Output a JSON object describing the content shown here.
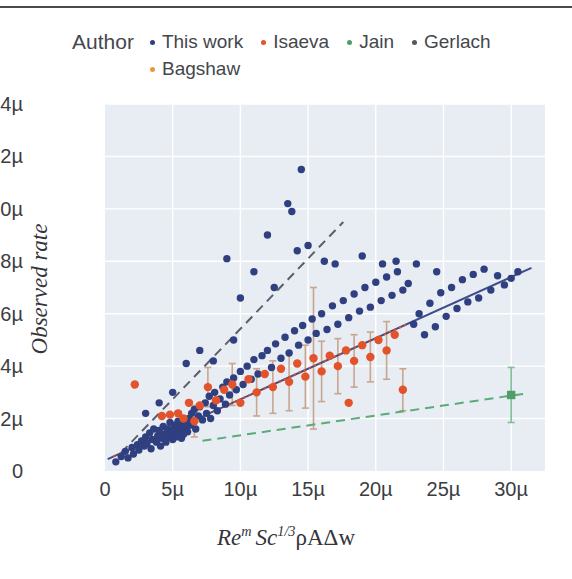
{
  "figure": {
    "background": "#ffffff",
    "plot_background": "#e7edf2",
    "gridline_color": "#ffffff"
  },
  "legend": {
    "title": "Author",
    "entries": [
      {
        "label": "This work",
        "color": "#2f3f7f",
        "row": 1
      },
      {
        "label": "Isaeva",
        "color": "#e2522b",
        "row": 1
      },
      {
        "label": "Jain",
        "color": "#4f9e6a",
        "row": 1
      },
      {
        "label": "Gerlach",
        "color": "#55585f",
        "row": 1
      },
      {
        "label": "Bagshaw",
        "color": "#e79a3c",
        "row": 2
      }
    ]
  },
  "chart_data": {
    "type": "scatter",
    "title": "",
    "xlabel": "Re^m Sc^{1/3} ρAΔw",
    "ylabel": "Observed rate",
    "xlabel_parts": {
      "re": "Re",
      "m": "m",
      "sc": "Sc",
      "third": "1/3",
      "tail": "ρAΔw"
    },
    "xlim": [
      0,
      32.5
    ],
    "ylim": [
      0,
      14
    ],
    "xticks": [
      0,
      5,
      10,
      15,
      20,
      25,
      30
    ],
    "xticklabels": [
      "0",
      "5µ",
      "10µ",
      "15µ",
      "20µ",
      "25µ",
      "30µ"
    ],
    "yticks": [
      0,
      2,
      4,
      6,
      8,
      10,
      12,
      14
    ],
    "yticklabels": [
      "0",
      "2µ",
      "4µ",
      "6µ",
      "8µ",
      "10µ",
      "12µ",
      "14µ"
    ],
    "grid": true,
    "grid_axis": "both",
    "legend_position": "above-plot",
    "units": "µ (micro)",
    "series": [
      {
        "name": "This work",
        "color": "#2f3f7f",
        "marker": "circle",
        "marker_size": 5,
        "points": [
          [
            0.8,
            0.35
          ],
          [
            1.2,
            0.55
          ],
          [
            1.5,
            0.75
          ],
          [
            1.7,
            0.5
          ],
          [
            2.0,
            0.9
          ],
          [
            2.1,
            0.65
          ],
          [
            2.4,
            1.0
          ],
          [
            2.5,
            0.8
          ],
          [
            2.7,
            1.15
          ],
          [
            2.9,
            0.95
          ],
          [
            3.0,
            1.3
          ],
          [
            3.1,
            1.05
          ],
          [
            3.3,
            1.45
          ],
          [
            3.4,
            0.85
          ],
          [
            3.5,
            1.2
          ],
          [
            3.6,
            1.6
          ],
          [
            3.8,
            1.1
          ],
          [
            3.9,
            1.35
          ],
          [
            4.0,
            1.55
          ],
          [
            4.1,
            0.95
          ],
          [
            4.2,
            1.25
          ],
          [
            4.3,
            1.7
          ],
          [
            4.4,
            1.4
          ],
          [
            4.5,
            1.1
          ],
          [
            4.6,
            1.6
          ],
          [
            4.7,
            1.3
          ],
          [
            4.8,
            1.85
          ],
          [
            4.9,
            1.45
          ],
          [
            5.0,
            1.2
          ],
          [
            5.05,
            1.6
          ],
          [
            5.1,
            1.35
          ],
          [
            5.15,
            1.75
          ],
          [
            5.2,
            1.5
          ],
          [
            5.25,
            1.3
          ],
          [
            5.3,
            1.65
          ],
          [
            5.35,
            1.45
          ],
          [
            5.4,
            1.9
          ],
          [
            5.45,
            1.55
          ],
          [
            5.5,
            1.35
          ],
          [
            5.55,
            1.7
          ],
          [
            5.6,
            1.5
          ],
          [
            5.65,
            1.25
          ],
          [
            5.7,
            1.8
          ],
          [
            5.75,
            1.6
          ],
          [
            5.8,
            1.4
          ],
          [
            5.9,
            1.95
          ],
          [
            6.0,
            1.7
          ],
          [
            6.1,
            1.5
          ],
          [
            6.2,
            2.0
          ],
          [
            6.3,
            1.75
          ],
          [
            6.4,
            2.2
          ],
          [
            6.5,
            1.9
          ],
          [
            6.6,
            2.35
          ],
          [
            6.7,
            1.6
          ],
          [
            6.9,
            2.1
          ],
          [
            7.0,
            2.45
          ],
          [
            7.2,
            1.95
          ],
          [
            7.4,
            2.6
          ],
          [
            7.5,
            2.2
          ],
          [
            7.7,
            2.85
          ],
          [
            7.8,
            2.0
          ],
          [
            8.0,
            2.5
          ],
          [
            8.1,
            3.0
          ],
          [
            8.3,
            2.3
          ],
          [
            8.5,
            2.75
          ],
          [
            8.7,
            3.2
          ],
          [
            8.9,
            2.55
          ],
          [
            9.0,
            3.4
          ],
          [
            9.2,
            2.9
          ],
          [
            9.5,
            3.55
          ],
          [
            9.7,
            3.1
          ],
          [
            10.0,
            3.8
          ],
          [
            10.2,
            3.3
          ],
          [
            10.5,
            4.0
          ],
          [
            10.8,
            3.5
          ],
          [
            11.0,
            4.25
          ],
          [
            11.3,
            3.7
          ],
          [
            11.6,
            4.4
          ],
          [
            12.0,
            4.6
          ],
          [
            12.3,
            3.95
          ],
          [
            12.6,
            4.85
          ],
          [
            13.0,
            4.3
          ],
          [
            13.3,
            5.1
          ],
          [
            13.6,
            4.5
          ],
          [
            14.0,
            5.35
          ],
          [
            14.3,
            4.8
          ],
          [
            14.6,
            5.55
          ],
          [
            15.0,
            5.0
          ],
          [
            15.3,
            5.8
          ],
          [
            15.6,
            5.25
          ],
          [
            16.0,
            6.0
          ],
          [
            16.4,
            5.4
          ],
          [
            16.8,
            6.3
          ],
          [
            17.2,
            5.6
          ],
          [
            17.6,
            6.5
          ],
          [
            18.0,
            5.85
          ],
          [
            18.4,
            6.75
          ],
          [
            18.8,
            6.1
          ],
          [
            19.2,
            7.0
          ],
          [
            19.6,
            6.25
          ],
          [
            20.0,
            7.2
          ],
          [
            20.4,
            6.5
          ],
          [
            20.8,
            7.4
          ],
          [
            21.2,
            6.7
          ],
          [
            21.6,
            7.6
          ],
          [
            22.0,
            6.9
          ],
          [
            22.4,
            7.15
          ],
          [
            22.8,
            5.6
          ],
          [
            23.2,
            6.0
          ],
          [
            23.6,
            5.2
          ],
          [
            24.0,
            6.4
          ],
          [
            24.4,
            5.5
          ],
          [
            24.8,
            6.8
          ],
          [
            25.2,
            5.9
          ],
          [
            25.6,
            7.0
          ],
          [
            26.0,
            6.2
          ],
          [
            26.4,
            7.3
          ],
          [
            26.8,
            6.45
          ],
          [
            27.2,
            7.5
          ],
          [
            27.6,
            6.6
          ],
          [
            28.0,
            7.7
          ],
          [
            28.5,
            6.9
          ],
          [
            29.0,
            7.45
          ],
          [
            29.5,
            7.1
          ],
          [
            30.0,
            7.35
          ],
          [
            30.5,
            7.6
          ],
          [
            14.5,
            11.5
          ],
          [
            13.5,
            10.2
          ],
          [
            12.0,
            9.0
          ],
          [
            15.0,
            8.6
          ],
          [
            16.2,
            8.0
          ],
          [
            9.0,
            8.1
          ],
          [
            13.8,
            9.9
          ],
          [
            14.2,
            8.4
          ],
          [
            11.0,
            7.6
          ],
          [
            17.0,
            7.9
          ],
          [
            12.5,
            7.0
          ],
          [
            10.0,
            6.6
          ],
          [
            19.0,
            8.2
          ],
          [
            20.5,
            7.9
          ],
          [
            21.5,
            8.0
          ],
          [
            23.0,
            7.9
          ],
          [
            24.5,
            7.6
          ],
          [
            6.0,
            4.1
          ],
          [
            7.0,
            4.6
          ],
          [
            8.0,
            4.2
          ],
          [
            9.5,
            5.0
          ],
          [
            5.0,
            3.0
          ],
          [
            4.0,
            2.6
          ],
          [
            3.0,
            2.2
          ]
        ]
      },
      {
        "name": "Isaeva",
        "color": "#e2522b",
        "marker": "circle",
        "marker_size": 6,
        "points": [
          [
            2.2,
            3.3
          ],
          [
            4.2,
            2.1
          ],
          [
            4.8,
            2.15
          ],
          [
            5.4,
            2.2
          ],
          [
            6.2,
            2.6
          ],
          [
            7.0,
            2.5
          ],
          [
            7.6,
            3.2
          ],
          [
            8.2,
            2.7
          ],
          [
            8.8,
            3.1
          ],
          [
            9.4,
            3.3
          ],
          [
            10.0,
            2.6
          ],
          [
            10.6,
            3.5
          ],
          [
            11.2,
            3.0
          ],
          [
            11.8,
            3.7
          ],
          [
            12.4,
            3.2
          ],
          [
            13.0,
            3.9
          ],
          [
            13.6,
            3.4
          ],
          [
            14.2,
            4.1
          ],
          [
            14.8,
            3.6
          ],
          [
            15.4,
            4.3
          ],
          [
            16.0,
            3.8
          ],
          [
            16.6,
            4.4
          ],
          [
            17.2,
            4.0
          ],
          [
            17.8,
            4.6
          ],
          [
            18.4,
            4.2
          ],
          [
            19.0,
            4.8
          ],
          [
            19.6,
            4.35
          ],
          [
            20.2,
            5.0
          ],
          [
            20.8,
            4.6
          ],
          [
            21.4,
            5.2
          ],
          [
            22.0,
            3.1
          ],
          [
            18.0,
            2.6
          ],
          [
            6.6,
            1.9
          ],
          [
            5.8,
            2.0
          ]
        ],
        "error_bars": [
          [
            7.6,
            3.2,
            1.5
          ],
          [
            9.4,
            3.3,
            1.6
          ],
          [
            11.2,
            3.0,
            1.8
          ],
          [
            12.4,
            3.2,
            2.0
          ],
          [
            13.6,
            3.4,
            2.2
          ],
          [
            14.8,
            3.6,
            2.4
          ],
          [
            16.0,
            3.8,
            2.3
          ],
          [
            17.2,
            4.0,
            2.1
          ],
          [
            18.4,
            4.2,
            2.0
          ],
          [
            19.6,
            4.35,
            1.9
          ],
          [
            20.8,
            4.6,
            2.2
          ],
          [
            22.0,
            3.1,
            1.6
          ],
          [
            15.4,
            4.3,
            5.4
          ],
          [
            6.6,
            1.9,
            1.2
          ]
        ]
      },
      {
        "name": "Jain",
        "color": "#4f9e6a",
        "marker": "square",
        "marker_size": 6,
        "points": [
          [
            30.0,
            2.9
          ]
        ],
        "error_bars": [
          [
            30.0,
            2.9,
            2.1
          ]
        ]
      },
      {
        "name": "Bagshaw",
        "color": "#e79a3c",
        "marker": "circle",
        "marker_size": 5,
        "points": []
      }
    ],
    "trend_lines": [
      {
        "name": "This work fit",
        "color": "#3d4c8c",
        "style": "solid",
        "x0": 0.2,
        "y0": 0.45,
        "x1": 31.5,
        "y1": 7.75,
        "width": 2
      },
      {
        "name": "Isaeva fit",
        "color": "#d1502c",
        "style": "dotted",
        "x0": 0.6,
        "y0": 0.55,
        "x1": 22.3,
        "y1": 5.6,
        "width": 2
      },
      {
        "name": "Gerlach fit",
        "color": "#5a5f6d",
        "style": "dashed",
        "x0": 1.2,
        "y0": 0.7,
        "x1": 17.6,
        "y1": 9.5,
        "width": 2
      },
      {
        "name": "Jain fit",
        "color": "#5aab77",
        "style": "dashed",
        "x0": 7.2,
        "y0": 1.15,
        "x1": 31.0,
        "y1": 2.95,
        "width": 2
      }
    ]
  }
}
